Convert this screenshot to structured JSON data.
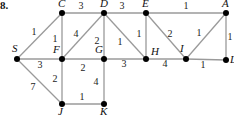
{
  "problem_number": "8.",
  "nodes": [
    {
      "id": "S",
      "x": 17,
      "y": 59,
      "lx": 12,
      "ly": 52
    },
    {
      "id": "C",
      "x": 62,
      "y": 13,
      "lx": 58,
      "ly": 7
    },
    {
      "id": "D",
      "x": 104,
      "y": 13,
      "lx": 100,
      "ly": 7
    },
    {
      "id": "E",
      "x": 146,
      "y": 13,
      "lx": 142,
      "ly": 7
    },
    {
      "id": "A",
      "x": 226,
      "y": 13,
      "lx": 222,
      "ly": 7
    },
    {
      "id": "F",
      "x": 62,
      "y": 59,
      "lx": 53,
      "ly": 53
    },
    {
      "id": "G",
      "x": 104,
      "y": 59,
      "lx": 95,
      "ly": 53
    },
    {
      "id": "H",
      "x": 146,
      "y": 59,
      "lx": 151,
      "ly": 55
    },
    {
      "id": "I",
      "x": 186,
      "y": 59,
      "lx": 180,
      "ly": 52
    },
    {
      "id": "L",
      "x": 226,
      "y": 60,
      "lx": 230,
      "ly": 63
    },
    {
      "id": "J",
      "x": 62,
      "y": 104,
      "lx": 58,
      "ly": 115
    },
    {
      "id": "K",
      "x": 104,
      "y": 104,
      "lx": 100,
      "ly": 115
    }
  ],
  "edges": [
    {
      "from": "S",
      "to": "C",
      "weight": "1",
      "wx": 34,
      "wy": 35
    },
    {
      "from": "S",
      "to": "F",
      "weight": "3",
      "wx": 40,
      "wy": 68
    },
    {
      "from": "S",
      "to": "J",
      "weight": "7",
      "wx": 33,
      "wy": 90
    },
    {
      "from": "C",
      "to": "D",
      "weight": "3",
      "wx": 81,
      "wy": 9
    },
    {
      "from": "C",
      "to": "F",
      "weight": "1",
      "wx": 55,
      "wy": 42
    },
    {
      "from": "D",
      "to": "F",
      "weight": "4",
      "wx": 76,
      "wy": 37
    },
    {
      "from": "D",
      "to": "G",
      "weight": "2",
      "wx": 97,
      "wy": 44
    },
    {
      "from": "D",
      "to": "H",
      "weight": "1",
      "wx": 120,
      "wy": 45
    },
    {
      "from": "D",
      "to": "E",
      "weight": "3",
      "wx": 122,
      "wy": 9
    },
    {
      "from": "E",
      "to": "H",
      "weight": "1",
      "wx": 139,
      "wy": 37
    },
    {
      "from": "E",
      "to": "I",
      "weight": "2",
      "wx": 170,
      "wy": 37
    },
    {
      "from": "E",
      "to": "A",
      "weight": "1",
      "wx": 186,
      "wy": 9
    },
    {
      "from": "A",
      "to": "I",
      "weight": "1",
      "wx": 199,
      "wy": 36
    },
    {
      "from": "A",
      "to": "L",
      "weight": "1",
      "wx": 230,
      "wy": 40
    },
    {
      "from": "F",
      "to": "G",
      "weight": "2",
      "wx": 83,
      "wy": 71
    },
    {
      "from": "G",
      "to": "H",
      "weight": "3",
      "wx": 124,
      "wy": 67
    },
    {
      "from": "H",
      "to": "I",
      "weight": "4",
      "wx": 165,
      "wy": 67
    },
    {
      "from": "I",
      "to": "L",
      "weight": "1",
      "wx": 203,
      "wy": 68
    },
    {
      "from": "F",
      "to": "J",
      "weight": "2",
      "wx": 55,
      "wy": 82
    },
    {
      "from": "G",
      "to": "K",
      "weight": "4",
      "wx": 96,
      "wy": 85
    },
    {
      "from": "J",
      "to": "K",
      "weight": "1",
      "wx": 82,
      "wy": 100
    }
  ]
}
